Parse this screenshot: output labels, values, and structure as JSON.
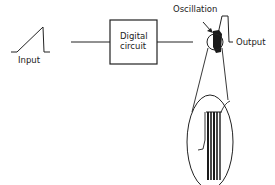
{
  "diagram": {
    "labels": {
      "input": "Input",
      "box_line1": "Digital",
      "box_line2": "circuit",
      "oscillation": "Oscillation",
      "output": "Output"
    },
    "colors": {
      "stroke": "#222222",
      "fill_dark": "#1a1a1a",
      "background": "#ffffff"
    },
    "components": [
      {
        "id": "input-ramp",
        "type": "ramp-waveform"
      },
      {
        "id": "digital-circuit",
        "type": "block"
      },
      {
        "id": "oscillation-point",
        "type": "magnified-spot"
      },
      {
        "id": "output-step",
        "type": "step-waveform"
      },
      {
        "id": "magnified-view",
        "type": "ellipse-inset"
      }
    ],
    "connections": [
      {
        "from": "input-ramp",
        "to": "digital-circuit"
      },
      {
        "from": "digital-circuit",
        "to": "output-step"
      }
    ]
  }
}
